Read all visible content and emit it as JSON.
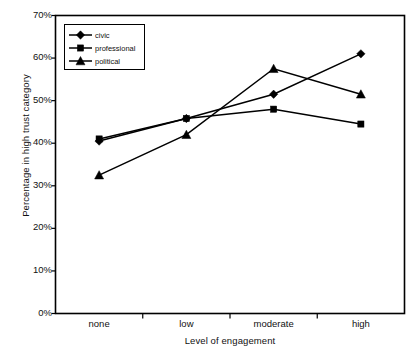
{
  "chart_data": {
    "type": "line",
    "title": "",
    "xlabel": "Level of engagement",
    "ylabel": "Percentage in high trust category",
    "categories": [
      "none",
      "low",
      "moderate",
      "high"
    ],
    "ylim": [
      0,
      70
    ],
    "ytick_labels": [
      "0%",
      "10%",
      "20%",
      "30%",
      "40%",
      "50%",
      "60%",
      "70%"
    ],
    "ytick_values": [
      0,
      10,
      20,
      30,
      40,
      50,
      60,
      70
    ],
    "grid": false,
    "legend_position": "top-left-inside",
    "series": [
      {
        "name": "civic",
        "marker": "diamond",
        "color": "#000000",
        "values": [
          40.5,
          45.8,
          51.5,
          61.0
        ]
      },
      {
        "name": "professional",
        "marker": "square",
        "color": "#000000",
        "values": [
          41.0,
          45.8,
          48.0,
          44.5
        ]
      },
      {
        "name": "political",
        "marker": "triangle",
        "color": "#000000",
        "values": [
          32.5,
          42.0,
          57.5,
          51.5
        ]
      }
    ]
  },
  "axis": {
    "y_title": "Percentage in high trust category",
    "x_title": "Level of engagement"
  },
  "legend": {
    "items": [
      {
        "label": "civic",
        "marker": "diamond"
      },
      {
        "label": "professional",
        "marker": "square"
      },
      {
        "label": "political",
        "marker": "triangle"
      }
    ]
  },
  "ticks": {
    "y": [
      "0%",
      "10%",
      "20%",
      "30%",
      "40%",
      "50%",
      "60%",
      "70%"
    ],
    "x": [
      "none",
      "low",
      "moderate",
      "high"
    ]
  }
}
